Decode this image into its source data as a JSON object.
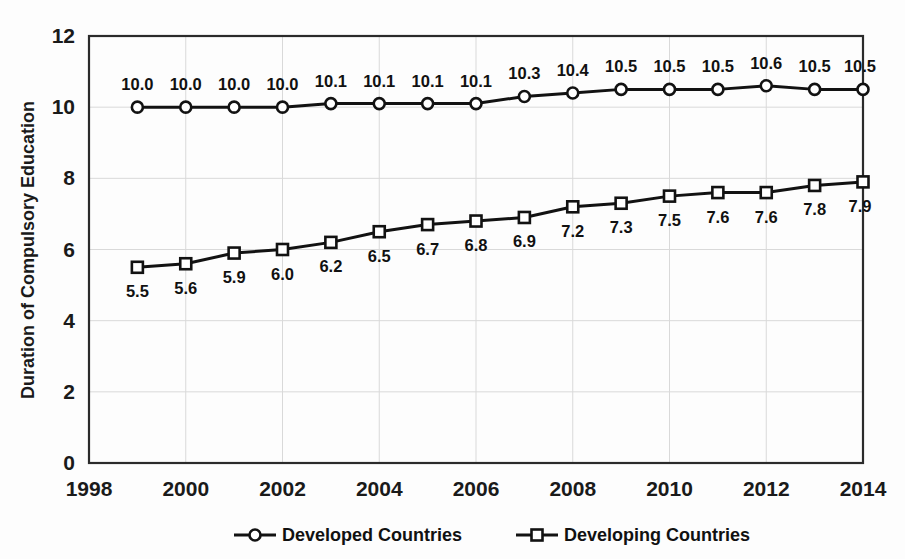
{
  "chart_data": {
    "type": "line",
    "title": "",
    "xlabel": "",
    "ylabel": "Duration of Compulsory Education",
    "xlim": [
      1998,
      2014
    ],
    "ylim": [
      0,
      12
    ],
    "xticks": [
      1998,
      2000,
      2002,
      2004,
      2006,
      2008,
      2010,
      2012,
      2014
    ],
    "yticks": [
      0,
      2,
      4,
      6,
      8,
      10,
      12
    ],
    "grid": true,
    "legend_position": "bottom",
    "x": [
      1999,
      2000,
      2001,
      2002,
      2003,
      2004,
      2005,
      2006,
      2007,
      2008,
      2009,
      2010,
      2011,
      2012,
      2013,
      2014
    ],
    "series": [
      {
        "name": "Developed Countries",
        "marker": "circle",
        "label_position": "above",
        "values": [
          10.0,
          10.0,
          10.0,
          10.0,
          10.1,
          10.1,
          10.1,
          10.1,
          10.3,
          10.4,
          10.5,
          10.5,
          10.5,
          10.6,
          10.5,
          10.5
        ],
        "labels": [
          "10.0",
          "10.0",
          "10.0",
          "10.0",
          "10.1",
          "10.1",
          "10.1",
          "10.1",
          "10.3",
          "10.4",
          "10.5",
          "10.5",
          "10.5",
          "10.6",
          "10.5",
          "10.5"
        ]
      },
      {
        "name": "Developing Countries",
        "marker": "square",
        "label_position": "below",
        "values": [
          5.5,
          5.6,
          5.9,
          6.0,
          6.2,
          6.5,
          6.7,
          6.8,
          6.9,
          7.2,
          7.3,
          7.5,
          7.6,
          7.6,
          7.8,
          7.9
        ],
        "labels": [
          "5.5",
          "5.6",
          "5.9",
          "6.0",
          "6.2",
          "6.5",
          "6.7",
          "6.8",
          "6.9",
          "7.2",
          "7.3",
          "7.5",
          "7.6",
          "7.6",
          "7.8",
          "7.9"
        ]
      }
    ]
  },
  "colors": {
    "line": "#121212",
    "marker_fill": "#ffffff",
    "grid": "#d9d9d9",
    "border": "#2b2b2b",
    "text": "#111111",
    "background": "#fdfdfd"
  },
  "legend": {
    "items": [
      {
        "label": "Developed Countries",
        "marker": "circle"
      },
      {
        "label": "Developing Countries",
        "marker": "square"
      }
    ]
  }
}
